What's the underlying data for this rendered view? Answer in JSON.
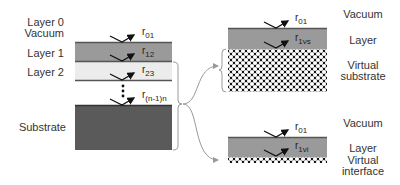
{
  "left_stack": {
    "labels": {
      "layer0": "Layer 0",
      "vacuum": "Vacuum",
      "layer1": "Layer 1",
      "layer2": "Layer 2",
      "substrate": "Substrate"
    },
    "reflections": [
      {
        "base": "r",
        "sub": "01"
      },
      {
        "base": "r",
        "sub": "12"
      },
      {
        "base": "r",
        "sub": "23"
      },
      {
        "base": "r",
        "sub": "(n-1)n"
      }
    ],
    "colors": {
      "layer1": "#9a9a9a",
      "layer2": "#ececec",
      "substrate": "#5a5a5a",
      "interface_line": "#555555"
    }
  },
  "right_top_stack": {
    "labels": {
      "vacuum": "Vacuum",
      "layer": "Layer",
      "virtual_line1": "Virtual",
      "virtual_line2": "substrate"
    },
    "reflections": [
      {
        "base": "r",
        "sub": "01"
      },
      {
        "base": "r",
        "sub": "1vs"
      }
    ]
  },
  "right_bottom_stack": {
    "labels": {
      "vacuum": "Vacuum",
      "layer": "Layer",
      "virtual_line1": "Virtual",
      "virtual_line2": "interface"
    },
    "reflections": [
      {
        "base": "r",
        "sub": "01"
      },
      {
        "base": "r",
        "sub": "1vi"
      }
    ]
  }
}
